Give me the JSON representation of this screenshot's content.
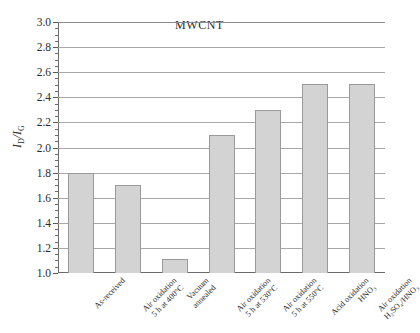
{
  "chart_data": {
    "type": "bar",
    "title": "MWCNT",
    "xlabel": "",
    "ylabel": "ID/IG",
    "ylabel_parts": {
      "prefix": "I",
      "sub1": "D",
      "mid": "/I",
      "sub2": "G"
    },
    "ylim": [
      1.0,
      3.0
    ],
    "ytick_step": 0.2,
    "ytick_minor_step": 0.05,
    "grid": true,
    "grid_axis": "y",
    "legend": "none",
    "categories": [
      "As-received",
      "Air oxidation 5 h at 400°C",
      "Vacuum annealed",
      "Air oxidation 5 h at 530°C",
      "Air oxidation 5 h at 550°C",
      "Acid oxidation HNO3",
      "Air oxidation H2SO4/HNO3"
    ],
    "category_lines": [
      [
        "As-received"
      ],
      [
        "Air oxidation",
        "5 h at 400°C"
      ],
      [
        "Vacuum",
        "annealed"
      ],
      [
        "Air oxidation",
        "5 h at 530°C"
      ],
      [
        "Air oxidation",
        "5 h at 550°C"
      ],
      [
        "Acid oxidation",
        "HNO₃"
      ],
      [
        "Air oxidation",
        "H₂SO₄/HNO₃"
      ]
    ],
    "values": [
      1.8,
      1.7,
      1.11,
      2.1,
      2.3,
      2.51,
      2.51
    ],
    "yticks": [
      {
        "value": 3.0,
        "label": "3.0"
      },
      {
        "value": 2.8,
        "label": "2.8"
      },
      {
        "value": 2.6,
        "label": "2.6"
      },
      {
        "value": 2.4,
        "label": "2.4"
      },
      {
        "value": 2.2,
        "label": "2.2"
      },
      {
        "value": 2.0,
        "label": "2.0"
      },
      {
        "value": 1.8,
        "label": "1.8"
      },
      {
        "value": 1.6,
        "label": "1.6"
      },
      {
        "value": 1.4,
        "label": "1.4"
      },
      {
        "value": 1.2,
        "label": "1.2"
      },
      {
        "value": 1.0,
        "label": "1.0"
      }
    ],
    "colors": {
      "bar_fill": "#d3d3d3",
      "bar_border": "#9a9a9a",
      "grid": "#a8a8a8",
      "axis": "#6b6b6b",
      "text": "#2b2b2b",
      "background": "#ffffff"
    }
  }
}
